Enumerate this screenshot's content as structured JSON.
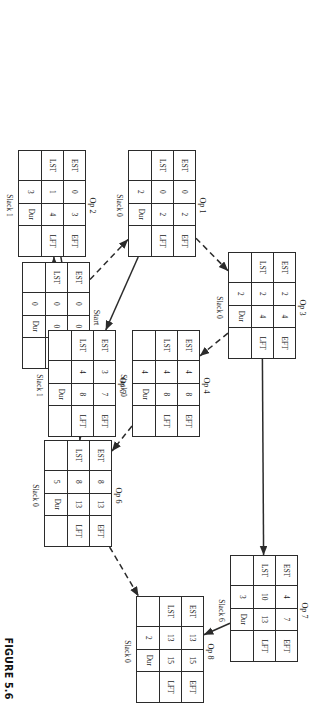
{
  "figure": {
    "caption": "FIGURE 5.6",
    "headers": {
      "est": "EST",
      "eft": "EFT",
      "lst": "LST",
      "lft": "LFT",
      "dur": "Dur"
    }
  },
  "nodes": [
    {
      "id": "start",
      "title": "Start",
      "est": "0",
      "eft": "0",
      "lst": "0",
      "lft": "0",
      "dur": "0",
      "slack": "",
      "x": 262,
      "y": 226
    },
    {
      "id": "op1",
      "title": "Op 1",
      "est": "0",
      "eft": "2",
      "lst": "0",
      "lft": "2",
      "dur": "2",
      "slack": "Slack 0",
      "x": 150,
      "y": 120
    },
    {
      "id": "op2",
      "title": "Op 2",
      "est": "0",
      "eft": "3",
      "lst": "1",
      "lft": "4",
      "dur": "3",
      "slack": "Slack 1",
      "x": 150,
      "y": 230
    },
    {
      "id": "op3",
      "title": "Op 3",
      "est": "2",
      "eft": "4",
      "lst": "2",
      "lft": "4",
      "dur": "2",
      "slack": "Slack 0",
      "x": 252,
      "y": 20
    },
    {
      "id": "op4",
      "title": "Op 4",
      "est": "4",
      "eft": "8",
      "lst": "4",
      "lft": "8",
      "dur": "4",
      "slack": "Slack 0",
      "x": 330,
      "y": 116
    },
    {
      "id": "op5",
      "title": "Op 5",
      "est": "3",
      "eft": "7",
      "lst": "4",
      "lft": "8",
      "dur": "",
      "slack": "Slack 1",
      "x": 330,
      "y": 200
    },
    {
      "id": "op6",
      "title": "Op 6",
      "est": "8",
      "eft": "13",
      "lst": "8",
      "lft": "13",
      "dur": "5",
      "slack": "Slack 0",
      "x": 440,
      "y": 204
    },
    {
      "id": "op7",
      "title": "Op 7",
      "est": "4",
      "eft": "7",
      "lst": "10",
      "lft": "13",
      "dur": "3",
      "slack": "Slack 6",
      "x": 555,
      "y": 18
    },
    {
      "id": "op8",
      "title": "Op 8",
      "est": "13",
      "eft": "15",
      "lst": "13",
      "lft": "15",
      "dur": "2",
      "slack": "Slack 0",
      "x": 596,
      "y": 112
    }
  ],
  "edges": [
    {
      "from": "start",
      "to": "op1",
      "style": "dashed"
    },
    {
      "from": "start",
      "to": "op2",
      "style": "solid"
    },
    {
      "from": "op1",
      "to": "op3",
      "style": "dashed"
    },
    {
      "from": "op1",
      "to": "op5",
      "style": "solid"
    },
    {
      "from": "op2",
      "to": "op5",
      "style": "solid"
    },
    {
      "from": "op3",
      "to": "op7",
      "style": "solid"
    },
    {
      "from": "op3",
      "to": "op4",
      "style": "dashed"
    },
    {
      "from": "op4",
      "to": "op6",
      "style": "dashed"
    },
    {
      "from": "op5",
      "to": "op6",
      "style": "solid"
    },
    {
      "from": "op6",
      "to": "op8",
      "style": "dashed"
    },
    {
      "from": "op7",
      "to": "op8",
      "style": "solid"
    }
  ],
  "colors": {
    "ink": "#2b2b2b",
    "paper": "#ffffff"
  }
}
